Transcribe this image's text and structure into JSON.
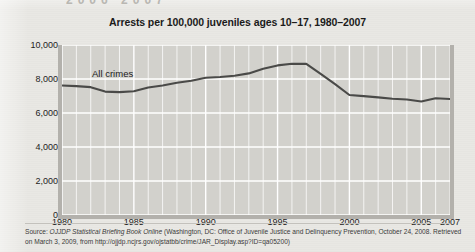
{
  "page": {
    "top_fragment": "2006  2007"
  },
  "figure": {
    "title": "Arrests per 100,000 juveniles ages 10–17, 1980–2007",
    "series_label": "All crimes",
    "source": {
      "prefix": "Source: ",
      "italic_title": "OJJDP Statistical Briefing Book Online",
      "rest": " (Washington, DC: Office of Juvenile Justice and Delinquency Prevention, October 24, 2008. Retrieved on March 3, 2009, from http://ojjdp.ncjrs.gov/ojstatbb/crime/JAR_Display.asp?ID=qa05200)"
    }
  },
  "colors": {
    "plot_background": "#d2d1cc",
    "gridline": "#ffffff",
    "series_line": "#4a4a48",
    "page_background": "#e9e8e4",
    "text": "#1b1b1b"
  },
  "chart_data": {
    "type": "line",
    "title": "Arrests per 100,000 juveniles ages 10–17, 1980–2007",
    "xlabel": "",
    "ylabel": "",
    "xlim": [
      1980,
      2007
    ],
    "ylim": [
      0,
      10000
    ],
    "yticks": [
      0,
      2000,
      4000,
      6000,
      8000,
      10000
    ],
    "ytick_labels": [
      "0",
      "2,000",
      "4,000",
      "6,000",
      "8,000",
      "10,000"
    ],
    "xticks": [
      1980,
      1985,
      1990,
      1995,
      2000,
      2005,
      2007
    ],
    "xtick_labels": [
      "1980",
      "1985",
      "1990",
      "1995",
      "2000",
      "2005",
      "2007"
    ],
    "grid": true,
    "grid_minor_x": true,
    "legend": "inline",
    "x": [
      1980,
      1981,
      1982,
      1983,
      1984,
      1985,
      1986,
      1987,
      1988,
      1989,
      1990,
      1991,
      1992,
      1993,
      1994,
      1995,
      1996,
      1997,
      1998,
      1999,
      2000,
      2001,
      2002,
      2003,
      2004,
      2005,
      2006,
      2007
    ],
    "series": [
      {
        "name": "All crimes",
        "values": [
          7620,
          7580,
          7520,
          7260,
          7230,
          7280,
          7500,
          7620,
          7780,
          7900,
          8070,
          8120,
          8190,
          8330,
          8600,
          8800,
          8900,
          8890,
          8300,
          7700,
          7060,
          6990,
          6920,
          6840,
          6790,
          6680,
          6870,
          6820
        ]
      }
    ]
  }
}
